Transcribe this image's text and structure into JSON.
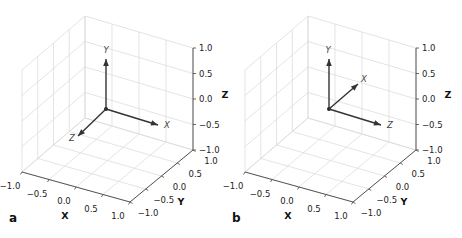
{
  "chart_data": [
    {
      "type": "3d-quiver",
      "panel_label": "a",
      "xlabel": "X",
      "ylabel": "Y",
      "zlabel": "Z",
      "xlim": [
        -1.0,
        1.0
      ],
      "ylim": [
        -1.0,
        1.0
      ],
      "zlim": [
        -1.0,
        1.0
      ],
      "xticks": [
        "−1.0",
        "−0.5",
        "0.0",
        "0.5",
        "1.0"
      ],
      "yticks": [
        "−1.0",
        "−0.5",
        "0.0",
        "0.5",
        "1.0"
      ],
      "zticks": [
        "−1.0",
        "−0.5",
        "0.0",
        "0.5",
        "1.0"
      ],
      "grid": true,
      "origin": [
        0,
        0,
        0
      ],
      "vectors": [
        {
          "label": "X",
          "screen_direction": "right-down"
        },
        {
          "label": "Y",
          "screen_direction": "up"
        },
        {
          "label": "Z",
          "screen_direction": "left-down"
        }
      ]
    },
    {
      "type": "3d-quiver",
      "panel_label": "b",
      "xlabel": "X",
      "ylabel": "Y",
      "zlabel": "Z",
      "xlim": [
        -1.0,
        1.0
      ],
      "ylim": [
        -1.0,
        1.0
      ],
      "zlim": [
        -1.0,
        1.0
      ],
      "xticks": [
        "−1.0",
        "−0.5",
        "0.0",
        "0.5",
        "1.0"
      ],
      "yticks": [
        "−1.0",
        "−0.5",
        "0.0",
        "0.5",
        "1.0"
      ],
      "zticks": [
        "−1.0",
        "−0.5",
        "0.0",
        "0.5",
        "1.0"
      ],
      "grid": true,
      "origin": [
        0,
        0,
        0
      ],
      "vectors": [
        {
          "label": "X",
          "screen_direction": "right-up"
        },
        {
          "label": "Y",
          "screen_direction": "up"
        },
        {
          "label": "Z",
          "screen_direction": "right-down"
        }
      ]
    }
  ],
  "panels": [
    {
      "offset_x": 0,
      "label": "a",
      "vec_labels": {
        "x": "X",
        "y": "Y",
        "z": "Z"
      }
    },
    {
      "offset_x": 223,
      "label": "b",
      "vec_labels": {
        "x": "X",
        "y": "Y",
        "z": "Z"
      }
    }
  ]
}
